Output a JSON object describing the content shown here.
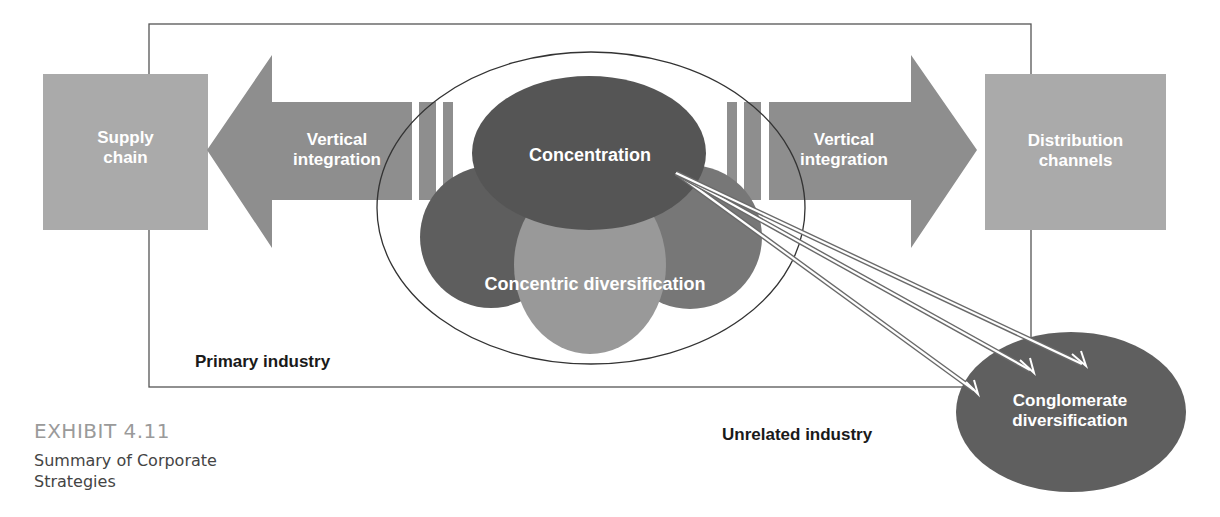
{
  "diagram": {
    "nodes": {
      "supply_chain": "Supply chain",
      "supply_chain_lines": [
        "Supply",
        "chain"
      ],
      "vertical_integration_left": [
        "Vertical",
        "integration"
      ],
      "vertical_integration_right": [
        "Vertical",
        "integration"
      ],
      "distribution_channels": [
        "Distribution",
        "channels"
      ],
      "concentration": "Concentration",
      "concentric_diversification": "Concentric diversification",
      "conglomerate_diversification": [
        "Conglomerate",
        "diversification"
      ]
    },
    "regions": {
      "primary_industry": "Primary industry",
      "unrelated_industry": "Unrelated industry"
    },
    "colors": {
      "light_box": "#aaaaaa",
      "arrow": "#8e8e8e",
      "concentration": "#555555",
      "left_circle": "#5e5e5e",
      "right_circle": "#777777",
      "center_circle": "#999999",
      "conglomerate": "#5f5f5f"
    }
  },
  "caption": {
    "exhibit": "EXHIBIT 4.11",
    "title": "Summary of Corporate Strategies"
  }
}
